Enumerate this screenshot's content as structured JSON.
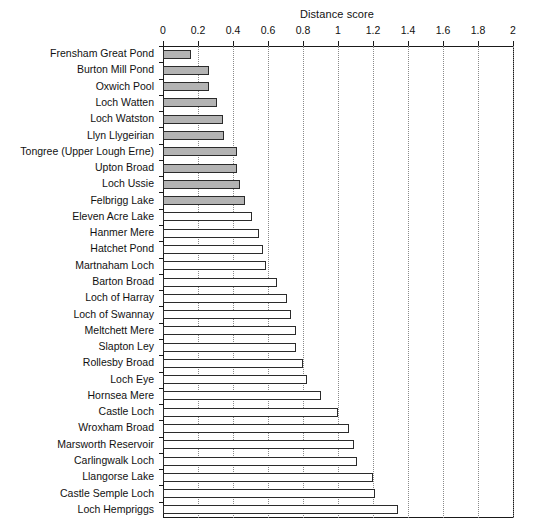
{
  "chart_data": {
    "type": "bar",
    "orientation": "horizontal",
    "title": "Distance score",
    "xlabel": "",
    "ylabel": "",
    "xlim": [
      0,
      2
    ],
    "xticks": [
      "0",
      "0.2",
      "0.4",
      "0.6",
      "0.8",
      "1",
      "1.2",
      "1.4",
      "1.6",
      "1.8",
      "2"
    ],
    "xtick_values": [
      0,
      0.2,
      0.4,
      0.6,
      0.8,
      1,
      1.2,
      1.4,
      1.6,
      1.8,
      2
    ],
    "grid": "vertical-dotted",
    "legend": "none",
    "bar_fill_gray": "#b3b3b3",
    "bar_fill_white": "#ffffff",
    "bar_edge": "#2b2b2b",
    "categories": [
      "Frensham Great Pond",
      "Burton Mill Pond",
      "Oxwich Pool",
      "Loch Watten",
      "Loch Watston",
      "Llyn Llygeirian",
      "Tongree (Upper Lough Erne)",
      "Upton Broad",
      "Loch Ussie",
      "Felbrigg Lake",
      "Eleven Acre Lake",
      "Hanmer Mere",
      "Hatchet Pond",
      "Martnaham Loch",
      "Barton Broad",
      "Loch of Harray",
      "Loch of Swannay",
      "Meltchett Mere",
      "Slapton Ley",
      "Rollesby Broad",
      "Loch Eye",
      "Hornsea Mere",
      "Castle Loch",
      "Wroxham Broad",
      "Marsworth Reservoir",
      "Carlingwalk Loch",
      "Llangorse Lake",
      "Castle Semple Loch",
      "Loch Hempriggs"
    ],
    "values": [
      0.16,
      0.26,
      0.26,
      0.31,
      0.34,
      0.35,
      0.42,
      0.42,
      0.44,
      0.47,
      0.51,
      0.55,
      0.57,
      0.59,
      0.65,
      0.71,
      0.73,
      0.76,
      0.76,
      0.8,
      0.82,
      0.9,
      1.0,
      1.06,
      1.09,
      1.11,
      1.2,
      1.21,
      1.34
    ],
    "fills": [
      "gray",
      "gray",
      "gray",
      "gray",
      "gray",
      "gray",
      "gray",
      "gray",
      "gray",
      "gray",
      "white",
      "white",
      "white",
      "white",
      "white",
      "white",
      "white",
      "white",
      "white",
      "white",
      "white",
      "white",
      "white",
      "white",
      "white",
      "white",
      "white",
      "white",
      "white"
    ]
  }
}
